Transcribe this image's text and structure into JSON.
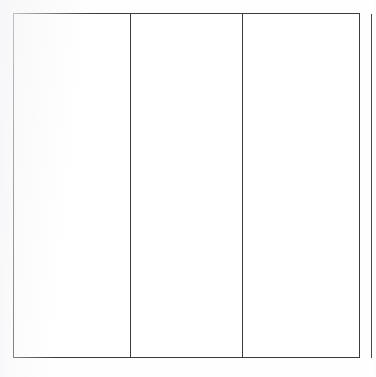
{
  "document": {
    "kind": "scanned-blank-form",
    "page_width": 376,
    "page_height": 377,
    "background_color": "#fefefe",
    "ink_color": "#3b3b40",
    "title": "",
    "header_text": "",
    "footer_text": ""
  },
  "table": {
    "name": "blank-three-column-table",
    "bounds": {
      "left": 13,
      "top": 13,
      "right": 360,
      "bottom": 358
    },
    "border_color": "#3b3b40",
    "border_width_px": 1,
    "row_count": 1,
    "column_count": 3,
    "column_divider_x": [
      130,
      242
    ],
    "headers": [
      "",
      "",
      ""
    ],
    "rows": [
      {
        "cells": [
          "",
          "",
          ""
        ]
      }
    ],
    "columns": [
      {
        "label": "",
        "content": "",
        "width_px": 117
      },
      {
        "label": "",
        "content": "",
        "width_px": 112
      },
      {
        "label": "",
        "content": "",
        "width_px": 118
      }
    ]
  },
  "page_edge_rule": {
    "label": "",
    "x": 371,
    "top": 14,
    "bottom": 358,
    "color": "#45454a"
  },
  "margins": {
    "left_band_label": "",
    "right_band_label": ""
  }
}
